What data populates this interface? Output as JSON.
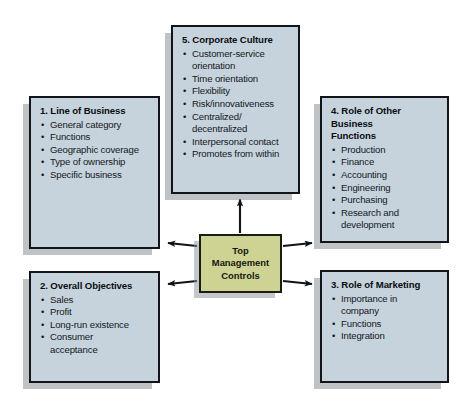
{
  "diagram": {
    "title_text": "Top Management Controls framework",
    "colors": {
      "box_fill": "#c6d3dd",
      "center_fill": "#ced394",
      "border": "#111418",
      "shadow": "#8c9196",
      "text": "#14181c",
      "background": "#ffffff"
    },
    "center": {
      "label": "Top\nManagement\nControls"
    },
    "boxes": [
      {
        "id": "line-of-business",
        "title": "1. Line of Business",
        "items": [
          "General category",
          "Functions",
          "Geographic coverage",
          "Type of ownership",
          "Specific business"
        ]
      },
      {
        "id": "overall-objectives",
        "title": "2. Overall Objectives",
        "items": [
          "Sales",
          "Profit",
          "Long-run existence",
          "Consumer\nacceptance"
        ]
      },
      {
        "id": "role-of-marketing",
        "title": "3. Role of Marketing",
        "items": [
          "Importance in\ncompany",
          "Functions",
          "Integration"
        ]
      },
      {
        "id": "role-of-other-business-functions",
        "title": "4. Role of Other\n    Business\n    Functions",
        "items": [
          "Production",
          "Finance",
          "Accounting",
          "Engineering",
          "Purchasing",
          "Research and\ndevelopment"
        ]
      },
      {
        "id": "corporate-culture",
        "title": "5. Corporate Culture",
        "items": [
          "Customer-service\norientation",
          "Time orientation",
          "Flexibility",
          "Risk/innovativeness",
          "Centralized/\ndecentralized",
          "Interpersonal contact",
          "Promotes from within"
        ]
      }
    ],
    "arrows": [
      {
        "id": "arrow-to-corporate-culture",
        "direction": "up"
      },
      {
        "id": "arrow-to-line-of-business",
        "direction": "up-left"
      },
      {
        "id": "arrow-to-overall-objectives",
        "direction": "down-left"
      },
      {
        "id": "arrow-to-role-of-other-business-functions",
        "direction": "up-right"
      },
      {
        "id": "arrow-to-role-of-marketing",
        "direction": "down-right"
      }
    ]
  }
}
